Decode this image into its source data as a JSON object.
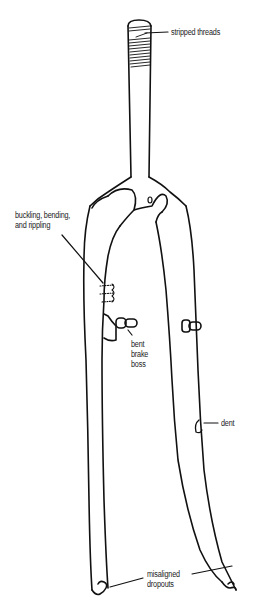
{
  "diagram": {
    "line_color": "#111111",
    "background": "#ffffff",
    "labels": {
      "stripped_threads": [
        "stripped threads"
      ],
      "buckling": [
        "buckling, bending,",
        "and rippling"
      ],
      "brake_boss": [
        "bent",
        "brake",
        "boss"
      ],
      "dent": [
        "dent"
      ],
      "dropouts": [
        "misaligned",
        "dropouts"
      ]
    }
  }
}
